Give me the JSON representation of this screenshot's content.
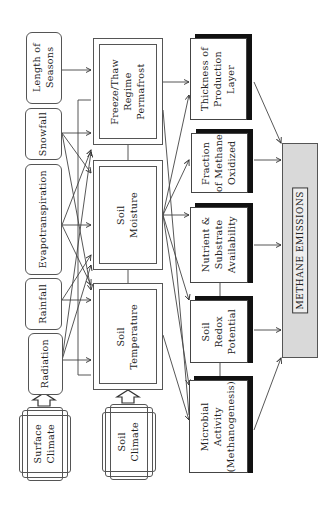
{
  "diagram": {
    "type": "flowchart",
    "orientation": "rotated-90-ccw",
    "inputs": [
      {
        "id": "length-of-seasons",
        "label": "Length of\nSeasons"
      },
      {
        "id": "snowfall",
        "label": "Snowfall"
      },
      {
        "id": "evapotranspiration",
        "label": "Evapotranspiration"
      },
      {
        "id": "rainfall",
        "label": "Rainfall"
      },
      {
        "id": "radiation",
        "label": "Radiation"
      }
    ],
    "climate": [
      {
        "id": "surface-climate",
        "label": "Surface\nClimate"
      },
      {
        "id": "soil-climate",
        "label": "Soil\nClimate"
      }
    ],
    "soil_states": [
      {
        "id": "freeze-thaw",
        "label": "Freeze/Thaw\nRegime\nPermafrost"
      },
      {
        "id": "soil-moisture",
        "label": "Soil\nMoisture"
      },
      {
        "id": "soil-temperature",
        "label": "Soil\nTemperature"
      }
    ],
    "processes": [
      {
        "id": "thickness",
        "label": "Thickness of\nProduction\nLayer"
      },
      {
        "id": "fraction-oxidized",
        "label": "Fraction\nof Methane\nOxidized"
      },
      {
        "id": "nutrient",
        "label": "Nutrient &\nSubstrate\nAvailability"
      },
      {
        "id": "redox",
        "label": "Soil\nRedox\nPotential"
      },
      {
        "id": "microbial",
        "label": "Microbial\nActivity\n(Methanogenesis)"
      }
    ],
    "output": {
      "id": "methane-emissions",
      "label": "METHANE EMISSIONS"
    }
  }
}
